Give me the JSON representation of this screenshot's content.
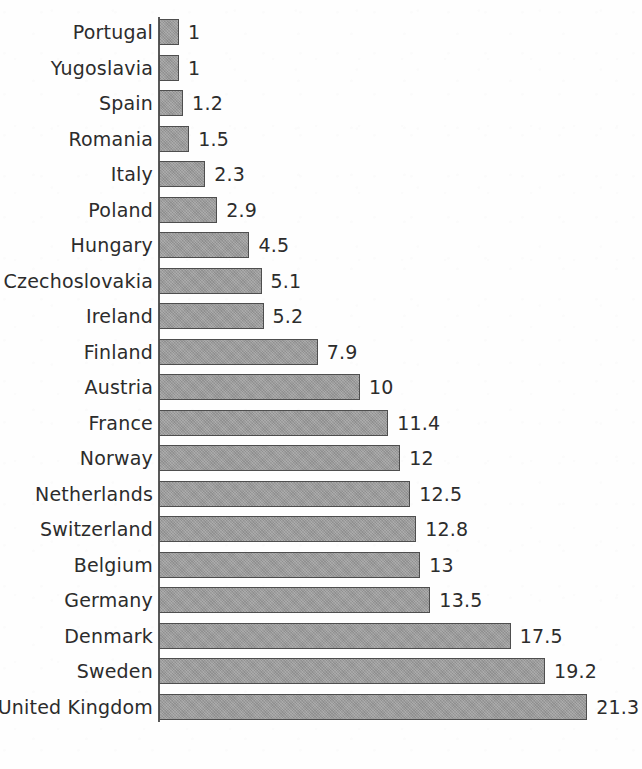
{
  "chart_data": {
    "type": "bar",
    "orientation": "horizontal",
    "title": "",
    "subtitle": "",
    "xlabel": "",
    "ylabel": "",
    "xlim": [
      0,
      21.3
    ],
    "grid": false,
    "legend": null,
    "value_labels_shown": true,
    "sort_order": "ascending-by-value-top-to-bottom",
    "categories": [
      "Portugal",
      "Yugoslavia",
      "Spain",
      "Romania",
      "Italy",
      "Poland",
      "Hungary",
      "Czechoslovakia",
      "Ireland",
      "Finland",
      "Austria",
      "France",
      "Norway",
      "Netherlands",
      "Switzerland",
      "Belgium",
      "Germany",
      "Denmark",
      "Sweden",
      "United Kingdom"
    ],
    "values": [
      1,
      1,
      1.2,
      1.5,
      2.3,
      2.9,
      4.5,
      5.1,
      5.2,
      7.9,
      10,
      11.4,
      12,
      12.5,
      12.8,
      13,
      13.5,
      17.5,
      19.2,
      21.3
    ],
    "value_labels": [
      "1",
      "1",
      "1.2",
      "1.5",
      "2.3",
      "2.9",
      "4.5",
      "5.1",
      "5.2",
      "7.9",
      "10",
      "11.4",
      "12",
      "12.5",
      "12.8",
      "13",
      "13.5",
      "17.5",
      "19.2",
      "21.3"
    ],
    "colors": {
      "bar_fill": "#9a9a9a",
      "bar_border": "#4e4e4e",
      "axis": "#585858",
      "text": "#2c2c2c",
      "background": "#fefefe"
    }
  }
}
